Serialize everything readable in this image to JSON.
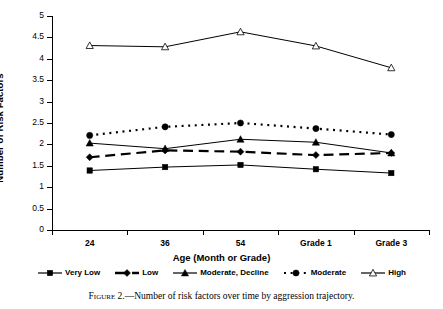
{
  "chart_data": {
    "type": "line",
    "title": "",
    "xlabel": "Age (Month or Grade)",
    "ylabel": "Number of Risk Factors",
    "categories": [
      "24",
      "36",
      "54",
      "Grade 1",
      "Grade 3"
    ],
    "ylim": [
      0,
      5
    ],
    "ytick_step": 0.5,
    "yticks": [
      "0",
      "0.5",
      "1",
      "1.5",
      "2",
      "2.5",
      "3",
      "3.5",
      "4",
      "4.5",
      "5"
    ],
    "grid": false,
    "legend_position": "bottom",
    "series": [
      {
        "name": "Very Low",
        "marker": "square-filled",
        "line": "solid",
        "values": [
          1.39,
          1.47,
          1.52,
          1.42,
          1.33
        ]
      },
      {
        "name": "Low",
        "marker": "diamond-filled",
        "line": "dashed",
        "values": [
          1.7,
          1.86,
          1.83,
          1.75,
          1.8
        ]
      },
      {
        "name": "Moderate, Decline",
        "marker": "triangle-filled",
        "line": "solid",
        "values": [
          2.03,
          1.9,
          2.12,
          2.05,
          1.8
        ]
      },
      {
        "name": "Moderate",
        "marker": "circle-filled",
        "line": "dotted",
        "values": [
          2.21,
          2.41,
          2.5,
          2.37,
          2.23
        ]
      },
      {
        "name": "High",
        "marker": "triangle-open",
        "line": "solid",
        "values": [
          4.31,
          4.28,
          4.63,
          4.3,
          3.79
        ]
      }
    ]
  },
  "caption": {
    "figure_number": "Figure 2.",
    "dash": "—",
    "text": "Number of risk factors over time by aggression trajectory."
  }
}
